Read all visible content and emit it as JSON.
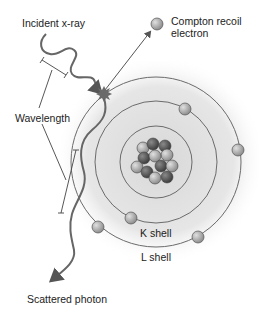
{
  "diagram": {
    "type": "compton-scattering",
    "labels": {
      "incident": "Incident x-ray",
      "compton_line1": "Compton recoil",
      "compton_line2": "electron",
      "wavelength": "Wavelength",
      "k_shell": "K shell",
      "l_shell": "L shell",
      "scattered": "Scattered photon"
    },
    "atom": {
      "center": [
        156,
        162
      ],
      "rings": [
        {
          "name": "inner",
          "radius": 36
        },
        {
          "name": "middle",
          "radius": 61
        },
        {
          "name": "outer",
          "radius": 85
        }
      ],
      "electrons": [
        {
          "ring": "middle",
          "x": 185,
          "y": 109
        },
        {
          "ring": "middle",
          "x": 131,
          "y": 218
        },
        {
          "ring": "outer",
          "x": 238,
          "y": 150
        },
        {
          "ring": "outer",
          "x": 98,
          "y": 227
        },
        {
          "ring": "outer",
          "x": 198,
          "y": 237
        }
      ],
      "nucleus_particles": 16
    },
    "colors": {
      "ring": "#6b6b6b",
      "proton": "#5e5e5e",
      "neutron": "#a8a8a8",
      "electron": "#a0a0a0",
      "glow": "#e4e4e4",
      "wave": "#666666",
      "text": "#222222"
    }
  }
}
